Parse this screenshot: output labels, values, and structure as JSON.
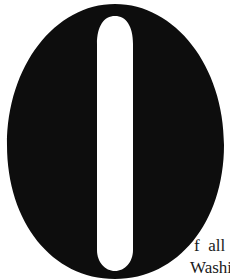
{
  "document": {
    "drop_cap": {
      "letter": "O",
      "color": "#0d0d0d",
      "background": "#ffffff"
    },
    "text_lines": [
      "f  all",
      "Washi"
    ]
  }
}
